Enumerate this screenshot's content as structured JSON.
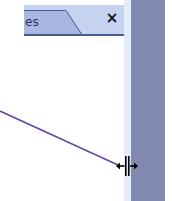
{
  "tabstrip": {
    "active_tab_label": "es",
    "close_label": "×"
  },
  "colors": {
    "tabstrip_bg": "#c5d3f0",
    "active_tab_bg": "#a9b6e2",
    "tab_border": "#4a5a8c",
    "side_panel": "#8189b1",
    "light_strip": "#e4ecfa",
    "line": "#6a4a9c"
  },
  "icons": {
    "close": "close-icon",
    "cursor": "resize-horizontal-cursor-icon"
  }
}
